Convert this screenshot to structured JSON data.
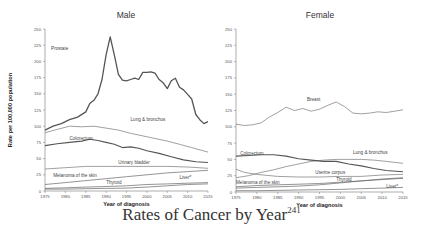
{
  "caption": {
    "text": "Rates of Cancer by Year",
    "superscript": "241"
  },
  "chart_data": [
    {
      "type": "line",
      "title": "Male",
      "xlabel": "Year of diagnosis",
      "ylabel": "Rate per 100,000 population",
      "ylim": [
        0,
        250
      ],
      "xlim": [
        1975,
        2015
      ],
      "yticks": [
        0,
        25,
        50,
        75,
        100,
        125,
        150,
        175,
        200,
        225,
        250
      ],
      "xticks": [
        1975,
        1980,
        1985,
        1990,
        1995,
        2000,
        2005,
        2010,
        2015
      ],
      "grid": false,
      "series": [
        {
          "name": "Prostate",
          "label_pos": [
            1976.5,
            218
          ],
          "width": 1.3,
          "color": "#555",
          "x": [
            1975,
            1977,
            1979,
            1981,
            1983,
            1985,
            1986,
            1987,
            1988,
            1989,
            1990,
            1991,
            1992,
            1993,
            1994,
            1995,
            1996,
            1997,
            1998,
            1999,
            2000,
            2001,
            2002,
            2003,
            2004,
            2005,
            2006,
            2007,
            2008,
            2009,
            2010,
            2011,
            2012,
            2013,
            2014,
            2015
          ],
          "values": [
            94,
            100,
            104,
            110,
            114,
            122,
            135,
            140,
            150,
            172,
            210,
            238,
            210,
            180,
            171,
            170,
            172,
            174,
            172,
            183,
            183,
            184,
            182,
            172,
            167,
            158,
            170,
            174,
            160,
            156,
            149,
            142,
            118,
            110,
            104,
            107
          ]
        },
        {
          "name": "Lung & bronchus",
          "label_pos": [
            1996,
            108
          ],
          "width": 0.7,
          "color": "#777",
          "x": [
            1975,
            1978,
            1981,
            1984,
            1987,
            1990,
            1993,
            1996,
            1999,
            2002,
            2005,
            2008,
            2011,
            2015
          ],
          "values": [
            90,
            95,
            100,
            99,
            100,
            97,
            94,
            89,
            85,
            81,
            77,
            72,
            67,
            60
          ]
        },
        {
          "name": "Colorectum",
          "label_pos": [
            1981,
            79
          ],
          "width": 1.1,
          "color": "#555",
          "x": [
            1975,
            1978,
            1981,
            1984,
            1986,
            1988,
            1990,
            1992,
            1994,
            1996,
            1998,
            2000,
            2003,
            2006,
            2009,
            2012,
            2015
          ],
          "values": [
            70,
            73,
            75,
            77,
            80,
            78,
            75,
            72,
            67,
            68,
            66,
            62,
            58,
            53,
            48,
            45,
            44
          ]
        },
        {
          "name": "Urinary bladder",
          "label_pos": [
            1993,
            42
          ],
          "width": 0.7,
          "color": "#777",
          "x": [
            1975,
            1980,
            1985,
            1990,
            1995,
            2000,
            2005,
            2010,
            2015
          ],
          "values": [
            34,
            36,
            38,
            38,
            38,
            38,
            38,
            37,
            35
          ]
        },
        {
          "name": "Melanoma of the skin",
          "label_pos": [
            1977,
            22
          ],
          "width": 0.7,
          "color": "#666",
          "x": [
            1975,
            1980,
            1985,
            1990,
            1995,
            2000,
            2005,
            2010,
            2015
          ],
          "values": [
            10,
            13,
            16,
            19,
            22,
            25,
            28,
            30,
            32
          ]
        },
        {
          "name": "Thyroid",
          "label_pos": [
            1990,
            11
          ],
          "width": 0.7,
          "color": "#666",
          "x": [
            1975,
            1980,
            1985,
            1990,
            1995,
            2000,
            2005,
            2010,
            2015
          ],
          "values": [
            3,
            3,
            3.5,
            4,
            4.5,
            6,
            8,
            10,
            11
          ]
        },
        {
          "name": "Liver*",
          "label_pos": [
            2008,
            19
          ],
          "width": 0.7,
          "color": "#666",
          "x": [
            1975,
            1980,
            1985,
            1990,
            1995,
            2000,
            2005,
            2010,
            2015
          ],
          "values": [
            4,
            5,
            6,
            7,
            8,
            10,
            11,
            12,
            13
          ]
        }
      ]
    },
    {
      "type": "line",
      "title": "Female",
      "xlabel": "Year of diagnosis",
      "ylabel": "",
      "ylim": [
        0,
        250
      ],
      "xlim": [
        1975,
        2015
      ],
      "yticks": [
        0,
        25,
        50,
        75,
        100,
        125,
        150,
        175,
        200,
        225,
        250
      ],
      "xticks": [
        1975,
        1980,
        1985,
        1990,
        1995,
        2000,
        2005,
        2010,
        2015
      ],
      "grid": false,
      "series": [
        {
          "name": "Breast",
          "label_pos": [
            1992,
            140
          ],
          "width": 0.7,
          "color": "#777",
          "x": [
            1975,
            1977,
            1979,
            1981,
            1983,
            1985,
            1987,
            1989,
            1991,
            1993,
            1995,
            1997,
            1999,
            2001,
            2003,
            2005,
            2007,
            2009,
            2011,
            2013,
            2015
          ],
          "values": [
            104,
            102,
            103,
            106,
            115,
            122,
            130,
            125,
            128,
            124,
            127,
            133,
            138,
            131,
            121,
            120,
            121,
            123,
            122,
            124,
            126
          ]
        },
        {
          "name": "Lung & bronchus",
          "label_pos": [
            2003,
            58
          ],
          "width": 0.7,
          "color": "#777",
          "x": [
            1975,
            1978,
            1981,
            1984,
            1987,
            1990,
            1993,
            1996,
            1999,
            2002,
            2005,
            2008,
            2011,
            2015
          ],
          "values": [
            22,
            25,
            30,
            34,
            39,
            43,
            47,
            49,
            50,
            50,
            50,
            49,
            47,
            44
          ]
        },
        {
          "name": "Colorectum",
          "label_pos": [
            1976,
            57
          ],
          "width": 1.1,
          "color": "#555",
          "x": [
            1975,
            1978,
            1981,
            1984,
            1987,
            1990,
            1993,
            1996,
            1999,
            2002,
            2005,
            2008,
            2011,
            2015
          ],
          "values": [
            55,
            56,
            57,
            57,
            55,
            51,
            49,
            47,
            47,
            43,
            40,
            36,
            33,
            31
          ]
        },
        {
          "name": "Uterine corpus",
          "label_pos": [
            1994,
            28
          ],
          "width": 0.7,
          "color": "#777",
          "x": [
            1975,
            1977,
            1980,
            1985,
            1990,
            1995,
            2000,
            2005,
            2010,
            2015
          ],
          "values": [
            35,
            30,
            27,
            24,
            23,
            23,
            24,
            24,
            26,
            27
          ]
        },
        {
          "name": "Melanoma of the skin",
          "label_pos": [
            1975,
            13
          ],
          "width": 0.7,
          "color": "#666",
          "x": [
            1975,
            1980,
            1985,
            1990,
            1995,
            2000,
            2005,
            2010,
            2015
          ],
          "values": [
            8,
            10,
            11,
            12,
            13,
            15,
            17,
            19,
            21
          ]
        },
        {
          "name": "Thyroid",
          "label_pos": [
            1999,
            17
          ],
          "width": 0.7,
          "color": "#666",
          "x": [
            1975,
            1980,
            1985,
            1990,
            1995,
            2000,
            2005,
            2010,
            2015
          ],
          "values": [
            6,
            7,
            8,
            9,
            11,
            14,
            17,
            20,
            22
          ]
        },
        {
          "name": "Liver*",
          "label_pos": [
            2011,
            6
          ],
          "width": 0.7,
          "color": "#666",
          "x": [
            1975,
            1980,
            1985,
            1990,
            1995,
            2000,
            2005,
            2010,
            2015
          ],
          "values": [
            2,
            2,
            2.5,
            3,
            3.5,
            4,
            5,
            6,
            7
          ]
        }
      ]
    }
  ]
}
